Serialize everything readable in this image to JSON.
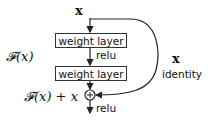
{
  "diagram": {
    "input_label": "x",
    "layers": [
      {
        "label": "weight layer"
      },
      {
        "label": "weight layer"
      }
    ],
    "activation_middle": "relu",
    "activation_output": "relu",
    "residual_function_label": "𝓕(x)",
    "output_label": "𝓕(x) + x",
    "shortcut_label_var": "x",
    "shortcut_label_text": "identity",
    "add_symbol": "+",
    "colors": {
      "stroke": "#222222",
      "background": "#ffffff"
    }
  }
}
